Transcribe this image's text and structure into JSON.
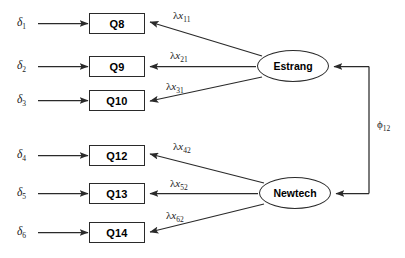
{
  "diagram": {
    "type": "sem-path-diagram",
    "background_color": "#ffffff",
    "line_color": "#2a2a2a",
    "indicators": [
      {
        "id": "q8",
        "label": "Q8",
        "x": 89,
        "y": 13,
        "w": 56,
        "h": 21
      },
      {
        "id": "q9",
        "label": "Q9",
        "x": 89,
        "y": 56,
        "w": 56,
        "h": 21
      },
      {
        "id": "q10",
        "label": "Q10",
        "x": 89,
        "y": 90,
        "w": 56,
        "h": 21
      },
      {
        "id": "q12",
        "label": "Q12",
        "x": 89,
        "y": 145,
        "w": 56,
        "h": 21
      },
      {
        "id": "q13",
        "label": "Q13",
        "x": 89,
        "y": 183,
        "w": 56,
        "h": 21
      },
      {
        "id": "q14",
        "label": "Q14",
        "x": 89,
        "y": 222,
        "w": 56,
        "h": 21
      }
    ],
    "latents": [
      {
        "id": "estrang",
        "label": "Estrang",
        "x": 257,
        "y": 50,
        "w": 72,
        "h": 32
      },
      {
        "id": "newtech",
        "label": "Newtech",
        "x": 259,
        "y": 177,
        "w": 72,
        "h": 32
      }
    ],
    "errors": [
      {
        "id": "d1",
        "symbol": "δ",
        "sub": "1",
        "x": 17,
        "y": 16
      },
      {
        "id": "d2",
        "symbol": "δ",
        "sub": "2",
        "x": 17,
        "y": 59
      },
      {
        "id": "d3",
        "symbol": "δ",
        "sub": "3",
        "x": 17,
        "y": 93
      },
      {
        "id": "d4",
        "symbol": "δ",
        "sub": "4",
        "x": 17,
        "y": 148
      },
      {
        "id": "d5",
        "symbol": "δ",
        "sub": "5",
        "x": 17,
        "y": 186
      },
      {
        "id": "d6",
        "symbol": "δ",
        "sub": "6",
        "x": 17,
        "y": 225
      }
    ],
    "loadings": [
      {
        "id": "lx11",
        "lambda": "λ",
        "xvar": "x",
        "sub": "11",
        "x": 173,
        "y": 9
      },
      {
        "id": "lx21",
        "lambda": "λ",
        "xvar": "x",
        "sub": "21",
        "x": 170,
        "y": 49
      },
      {
        "id": "lx31",
        "lambda": "λ",
        "xvar": "x",
        "sub": "31",
        "x": 166,
        "y": 80
      },
      {
        "id": "lx42",
        "lambda": "λ",
        "xvar": "x",
        "sub": "42",
        "x": 173,
        "y": 140
      },
      {
        "id": "lx52",
        "lambda": "λ",
        "xvar": "x",
        "sub": "52",
        "x": 170,
        "y": 177
      },
      {
        "id": "lx62",
        "lambda": "λ",
        "xvar": "x",
        "sub": "62",
        "x": 166,
        "y": 209
      }
    ],
    "correlation": {
      "id": "phi12",
      "symbol": "ϕ",
      "sub": "12",
      "x": 377,
      "y": 118
    }
  }
}
